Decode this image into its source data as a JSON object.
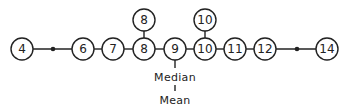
{
  "diagram": {
    "main_row": [
      {
        "value": "4",
        "x": 22
      },
      {
        "value": "6",
        "x": 83
      },
      {
        "value": "7",
        "x": 113
      },
      {
        "value": "8",
        "x": 144
      },
      {
        "value": "9",
        "x": 175
      },
      {
        "value": "10",
        "x": 205
      },
      {
        "value": "11",
        "x": 235
      },
      {
        "value": "12",
        "x": 265
      },
      {
        "value": "14",
        "x": 327
      }
    ],
    "stacked": [
      {
        "value": "8",
        "x": 144
      },
      {
        "value": "10",
        "x": 205
      }
    ],
    "gap_dots": [
      53,
      297
    ],
    "labels": {
      "median": "Median",
      "mean": "Mean"
    }
  }
}
